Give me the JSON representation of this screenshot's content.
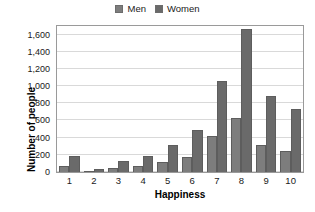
{
  "chart_data": {
    "type": "bar",
    "title": "",
    "xlabel": "Happiness",
    "ylabel": "Number of people",
    "categories": [
      "1",
      "2",
      "3",
      "4",
      "5",
      "6",
      "7",
      "8",
      "9",
      "10"
    ],
    "series": [
      {
        "name": "Men",
        "values": [
          70,
          10,
          50,
          70,
          115,
          180,
          415,
          625,
          310,
          240
        ],
        "color": "#7d7d7d"
      },
      {
        "name": "Women",
        "values": [
          185,
          30,
          130,
          190,
          310,
          490,
          1065,
          1660,
          885,
          730
        ],
        "color": "#6a6a6a"
      }
    ],
    "ylim": [
      0,
      1700
    ],
    "ytick_values": [
      0,
      200,
      400,
      600,
      800,
      1000,
      1200,
      1400,
      1600
    ],
    "ytick_labels": [
      "0",
      "200",
      "400",
      "600",
      "800",
      "1,000",
      "1,200",
      "1,400",
      "1,600"
    ],
    "grid": true,
    "grid_axis": "y",
    "legend": [
      "Men",
      "Women"
    ],
    "legend_position": "top-center"
  },
  "legend": {
    "items": [
      {
        "label": "Men",
        "swatch_name": "legend-swatch-men"
      },
      {
        "label": "Women",
        "swatch_name": "legend-swatch-women"
      }
    ]
  },
  "axes": {
    "x_title": "Happiness",
    "y_title": "Number of people"
  }
}
